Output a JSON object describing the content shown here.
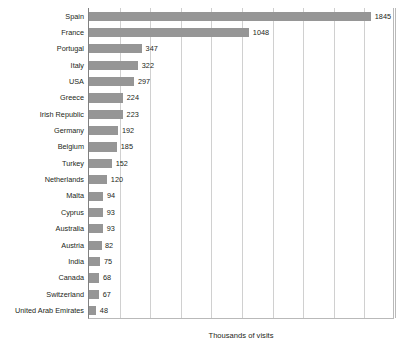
{
  "chart_data": {
    "type": "bar",
    "orientation": "horizontal",
    "title": "",
    "xlabel": "Thousands of visits",
    "ylabel": "",
    "xlim": [
      0,
      2000
    ],
    "grid": true,
    "legend": false,
    "gridline_count": 10,
    "bar_color": "#969696",
    "gridline_color": "#d0d0d0",
    "text_color": "#231f20",
    "categories": [
      "Spain",
      "France",
      "Portugal",
      "Italy",
      "USA",
      "Greece",
      "Irish Republic",
      "Germany",
      "Belgium",
      "Turkey",
      "Netherlands",
      "Malta",
      "Cyprus",
      "Australia",
      "Austria",
      "India",
      "Canada",
      "Switzerland",
      "United Arab Emirates"
    ],
    "values": [
      1845,
      1048,
      347,
      322,
      297,
      224,
      223,
      192,
      185,
      152,
      120,
      94,
      93,
      93,
      82,
      75,
      68,
      67,
      48
    ]
  }
}
